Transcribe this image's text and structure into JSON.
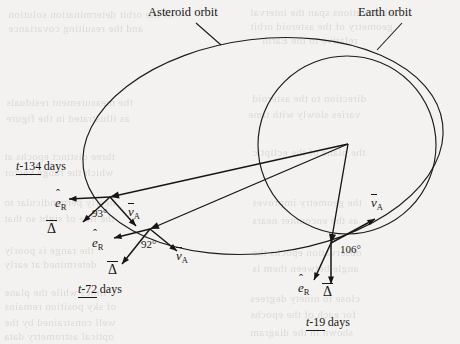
{
  "figure": {
    "name": "asteroid-earth-orbit-observation-geometry",
    "background_color": "#f3f2f0",
    "ink_color": "#1a1816",
    "width": 460,
    "height": 344
  },
  "callouts": [
    {
      "id": "asteroid-orbit",
      "label": "Asteroid orbit",
      "text_x": 148,
      "text_y": 16,
      "leader": {
        "x1": 196,
        "y1": 23,
        "x2": 221,
        "y2": 45
      }
    },
    {
      "id": "earth-orbit",
      "label": "Earth orbit",
      "text_x": 358,
      "text_y": 16,
      "leader": {
        "x1": 402,
        "y1": 23,
        "x2": 377,
        "y2": 50
      }
    }
  ],
  "orbits": {
    "asteroid": {
      "name": "Asteroid orbit",
      "shape": "ellipse",
      "cx": 263,
      "cy": 146,
      "rx": 181,
      "ry": 107,
      "rotation_deg": -7
    },
    "earth": {
      "name": "Earth orbit",
      "shape": "circle",
      "cx": 347,
      "cy": 145,
      "r": 89
    }
  },
  "observer": {
    "name": "earth-observation-vertex",
    "x": 348,
    "y": 144
  },
  "observations": [
    {
      "id": "t-134",
      "time_prefix": "t",
      "time_value": "-134",
      "time_units": "days",
      "time_label": "t-134 days",
      "time_label_x": 16,
      "time_label_y": 160,
      "asteroid_x": 110,
      "asteroid_y": 197,
      "angle_deg": 93,
      "angle_label": "93°",
      "angle_label_x": 92,
      "angle_label_y": 217,
      "range_vector": {
        "label": "range-arrow-t134",
        "tip_x": 110,
        "tip_y": 197
      },
      "vectors": [
        {
          "id": "e_R",
          "symbol": "e",
          "subscript": "R",
          "kind": "hat",
          "label": "êR",
          "tip_x": 69,
          "tip_y": 199,
          "label_x": 55,
          "label_y": 196
        },
        {
          "id": "Delta",
          "symbol": "Δ",
          "kind": "bar",
          "label": "Δ̄",
          "tip_x": 83,
          "tip_y": 222,
          "label_x": 47,
          "label_y": 222
        },
        {
          "id": "v_A",
          "symbol": "v",
          "subscript": "A",
          "kind": "bar",
          "label": "v̄A",
          "tip_x": 136,
          "tip_y": 226,
          "label_x": 128,
          "label_y": 205
        }
      ]
    },
    {
      "id": "t-72",
      "time_prefix": "t",
      "time_value": "-72",
      "time_units": "days",
      "time_label": "t-72 days",
      "time_label_x": 78,
      "time_label_y": 283,
      "asteroid_x": 150,
      "asteroid_y": 229,
      "angle_deg": 92,
      "angle_label": "92°",
      "angle_label_x": 141,
      "angle_label_y": 248,
      "range_vector": {
        "label": "range-arrow-t72",
        "tip_x": 150,
        "tip_y": 229
      },
      "vectors": [
        {
          "id": "e_R",
          "symbol": "e",
          "subscript": "R",
          "kind": "hat",
          "label": "êR",
          "tip_x": 114,
          "tip_y": 238,
          "label_x": 92,
          "label_y": 236
        },
        {
          "id": "Delta",
          "symbol": "Δ",
          "kind": "bar",
          "label": "Δ̄",
          "tip_x": 122,
          "tip_y": 264,
          "label_x": 108,
          "label_y": 263
        },
        {
          "id": "v_A",
          "symbol": "v",
          "subscript": "A",
          "kind": "bar",
          "label": "v̄A",
          "tip_x": 177,
          "tip_y": 251,
          "label_x": 176,
          "label_y": 249
        }
      ]
    },
    {
      "id": "t-19",
      "time_prefix": "t",
      "time_value": "-19",
      "time_units": "days",
      "time_label": "t-19 days",
      "time_label_x": 306,
      "time_label_y": 316,
      "asteroid_x": 331,
      "asteroid_y": 243,
      "angle_deg": 106,
      "angle_label": "106°",
      "angle_label_x": 340,
      "angle_label_y": 253,
      "range_vector": {
        "label": "range-arrow-t19",
        "tip_x": 331,
        "tip_y": 243
      },
      "vectors": [
        {
          "id": "e_R",
          "symbol": "e",
          "subscript": "R",
          "kind": "hat",
          "label": "êR",
          "tip_x": 314,
          "tip_y": 280,
          "label_x": 298,
          "label_y": 281
        },
        {
          "id": "Delta",
          "symbol": "Δ",
          "kind": "bar",
          "label": "Δ̄",
          "tip_x": 331,
          "tip_y": 284,
          "label_x": 323,
          "label_y": 285
        },
        {
          "id": "v_A",
          "symbol": "v",
          "subscript": "A",
          "kind": "bar",
          "label": "v̄A",
          "tip_x": 375,
          "tip_y": 219,
          "label_x": 371,
          "label_y": 196
        }
      ]
    }
  ],
  "bleed_text": [
    {
      "x": 8,
      "y": 8,
      "text": "of the orbit determination solution"
    },
    {
      "x": 8,
      "y": 22,
      "text": "and the resulting covariance"
    },
    {
      "x": 250,
      "y": 6,
      "text": "observations span the interval"
    },
    {
      "x": 250,
      "y": 20,
      "text": "geometry of the asteroid orbit"
    },
    {
      "x": 262,
      "y": 34,
      "text": "relative to the Earth"
    },
    {
      "x": 6,
      "y": 96,
      "text": "the measurement residuals"
    },
    {
      "x": 6,
      "y": 112,
      "text": "as illustrated in the figure"
    },
    {
      "x": 252,
      "y": 92,
      "text": "direction to the asteroid"
    },
    {
      "x": 248,
      "y": 108,
      "text": "varies slowly with time"
    },
    {
      "x": 4,
      "y": 150,
      "text": "three distinct epochs at"
    },
    {
      "x": 4,
      "y": 166,
      "text": "which the range vector"
    },
    {
      "x": 252,
      "y": 146,
      "text": "the plane of the ecliptic"
    },
    {
      "x": 4,
      "y": 196,
      "text": "nearly perpendicular to"
    },
    {
      "x": 4,
      "y": 212,
      "text": "the line of sight so that"
    },
    {
      "x": 252,
      "y": 196,
      "text": "the geometry improves"
    },
    {
      "x": 252,
      "y": 214,
      "text": "as the encounter nears"
    },
    {
      "x": 4,
      "y": 244,
      "text": "the range is poorly"
    },
    {
      "x": 4,
      "y": 258,
      "text": "determined at early"
    },
    {
      "x": 252,
      "y": 246,
      "text": "observation epochs the"
    },
    {
      "x": 252,
      "y": 262,
      "text": "angle between them is"
    },
    {
      "x": 4,
      "y": 286,
      "text": "times while the plane"
    },
    {
      "x": 4,
      "y": 300,
      "text": "of sky position remains"
    },
    {
      "x": 4,
      "y": 316,
      "text": "well constrained by the"
    },
    {
      "x": 4,
      "y": 330,
      "text": "optical astrometry data"
    },
    {
      "x": 250,
      "y": 292,
      "text": "close to ninety degrees"
    },
    {
      "x": 250,
      "y": 308,
      "text": "for each of the epochs"
    },
    {
      "x": 250,
      "y": 326,
      "text": "shown in the diagram"
    }
  ]
}
